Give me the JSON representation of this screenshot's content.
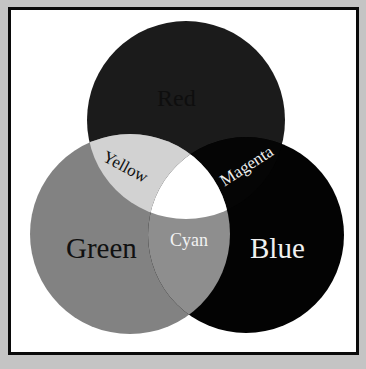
{
  "diagram": {
    "type": "venn",
    "colors": {
      "page_background": "#c4c4c4",
      "frame_border": "#0a0a0a",
      "frame_fill": "#ffffff",
      "red": "#1b1b1b",
      "green": "#828282",
      "blue": "#030303",
      "yellow": "#d2d2d2",
      "magenta": "#050505",
      "cyan": "#8e8e8e",
      "white_center": "#ffffff"
    },
    "sets": [
      {
        "name": "red",
        "label": "Red",
        "cx": 186,
        "cy": 120,
        "r": 99
      },
      {
        "name": "green",
        "label": "Green",
        "cx": 130,
        "cy": 234,
        "r": 100
      },
      {
        "name": "blue",
        "label": "Blue",
        "cx": 246,
        "cy": 235,
        "r": 98
      }
    ],
    "overlaps": [
      {
        "sets": [
          "red",
          "green"
        ],
        "label": "Yellow"
      },
      {
        "sets": [
          "red",
          "blue"
        ],
        "label": "Magenta"
      },
      {
        "sets": [
          "green",
          "blue"
        ],
        "label": "Cyan"
      },
      {
        "sets": [
          "red",
          "green",
          "blue"
        ],
        "label": ""
      }
    ]
  },
  "labels": {
    "red": "Red",
    "green": "Green",
    "blue": "Blue",
    "yellow": "Yellow",
    "magenta": "Magenta",
    "cyan": "Cyan"
  }
}
